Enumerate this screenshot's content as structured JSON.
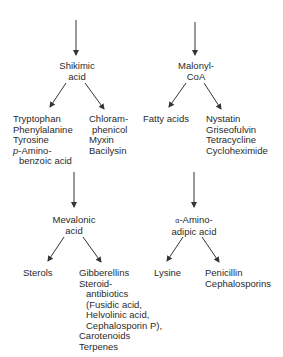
{
  "diagram": {
    "type": "biosynthetic-pathway",
    "top_left": {
      "precursor": {
        "line1": "Shikimic",
        "line2": "acid"
      },
      "products_left": [
        "Tryptophan",
        "Phenylalanine",
        "Tyrosine",
        "p-Amino-",
        "benzoic acid"
      ],
      "products_left_prefix_italic": "p",
      "products_left_amino": "-Amino-",
      "products_right": [
        "Chloram-",
        "phenicol",
        "Myxin",
        "Bacilysin"
      ]
    },
    "top_right": {
      "precursor": {
        "line1": "Malonyl-",
        "line2": "CoA"
      },
      "products_left": [
        "Fatty acids"
      ],
      "products_right": [
        "Nystatin",
        "Griseofulvin",
        "Tetracycline",
        "Cycloheximide"
      ]
    },
    "bottom_left": {
      "precursor": {
        "line1": "Mevalonic",
        "line2": "acid"
      },
      "products_left": [
        "Sterols"
      ],
      "products_right": [
        "Gibberellins",
        "Steroid-",
        "antibiotics",
        "(Fusidic acid,",
        "Helvolinic acid,",
        "Cephalosporin P),",
        "Carotenoids",
        "Terpenes"
      ]
    },
    "bottom_right": {
      "precursor": {
        "line1_greek": "α",
        "line1": "-Amino-",
        "line2": "adipic acid"
      },
      "products_left": [
        "Lysine"
      ],
      "products_right": [
        "Penicillin",
        "Cephalosporins"
      ]
    },
    "colors": {
      "line": "#333333",
      "text": "#2a2a2a",
      "background": "#ffffff"
    }
  }
}
